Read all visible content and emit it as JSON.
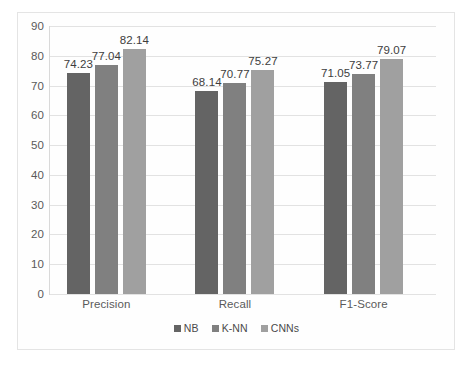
{
  "chart_data": {
    "type": "bar",
    "title": "",
    "subtitle": "",
    "xlabel": "",
    "ylabel": "",
    "categories": [
      "Precision",
      "Recall",
      "F1-Score"
    ],
    "series": [
      {
        "name": "NB",
        "color": "#646464",
        "values": [
          74.23,
          68.14,
          71.05
        ]
      },
      {
        "name": "K-NN",
        "color": "#808080",
        "values": [
          77.04,
          70.77,
          73.77
        ]
      },
      {
        "name": "CNNs",
        "color": "#a0a0a0",
        "values": [
          82.14,
          75.27,
          79.07
        ]
      }
    ],
    "data_labels": [
      "74.23",
      "77.04",
      "82.14",
      "68.14",
      "70.77",
      "75.27",
      "71.05",
      "73.77",
      "79.07"
    ],
    "ylim": [
      0,
      90
    ],
    "ytick_values": [
      0,
      10,
      20,
      30,
      40,
      50,
      60,
      70,
      80,
      90
    ],
    "ytick_labels": [
      "0",
      "10",
      "20",
      "30",
      "40",
      "50",
      "60",
      "70",
      "80",
      "90"
    ],
    "grid": true,
    "grid_axis": "y",
    "legend_position": "bottom",
    "legend_entries": [
      "NB",
      "K-NN",
      "CNNs"
    ],
    "colors": {
      "grid": "#e2e2e2",
      "axis": "#d9d9d9",
      "frame": "#e4e4e4",
      "tick_text": "#5a5a5a",
      "label_text": "#3d3d3d",
      "background": "#ffffff"
    }
  }
}
